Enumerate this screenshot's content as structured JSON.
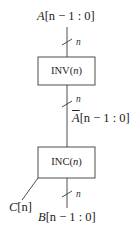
{
  "diagram": {
    "input": {
      "signal": "A",
      "range": "[n − 1 : 0]",
      "bus_width": "n"
    },
    "blocks": [
      {
        "name": "INV",
        "param": "n",
        "label": "INV(n)"
      },
      {
        "name": "INC",
        "param": "n",
        "label": "INC(n)"
      }
    ],
    "intermediate": {
      "signal": "A",
      "overlined": true,
      "range": "[n − 1 : 0]",
      "bus_width": "n"
    },
    "outputs": [
      {
        "signal": "C",
        "range": "[n]"
      },
      {
        "signal": "B",
        "range": "[n − 1 : 0]",
        "bus_width": "n"
      }
    ],
    "colors": {
      "stroke": "#3a3a3a",
      "background": "#ffffff"
    }
  }
}
